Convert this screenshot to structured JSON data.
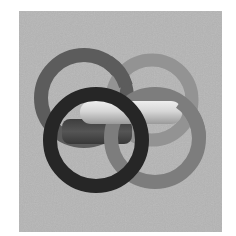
{
  "image": {
    "subject": "interlocking rings",
    "background_color": "#ffffff",
    "panel_color": "#b5b5b5",
    "rings": [
      {
        "name": "upper-left-ring",
        "cx": 84,
        "cy": 98,
        "r": 43,
        "stroke": 14,
        "color": "#5c5c5c"
      },
      {
        "name": "upper-right-ring",
        "cx": 152,
        "cy": 100,
        "r": 40,
        "stroke": 13,
        "color": "#939393"
      },
      {
        "name": "lower-right-ring",
        "cx": 155,
        "cy": 138,
        "r": 44,
        "stroke": 14,
        "color": "#7d7d7d"
      },
      {
        "name": "front-black-ring",
        "cx": 96,
        "cy": 140,
        "r": 46,
        "stroke": 14,
        "color": "#262626"
      }
    ],
    "links": [
      {
        "name": "light-horizontal-link",
        "x": 80,
        "y": 101,
        "w": 102,
        "h": 23,
        "color": "#d2d2d2"
      },
      {
        "name": "dark-horizontal-link",
        "x": 62,
        "y": 119,
        "w": 70,
        "h": 25,
        "color": "#4a4a4a"
      }
    ]
  }
}
